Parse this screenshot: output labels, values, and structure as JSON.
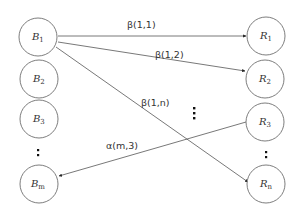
{
  "diagram": {
    "left_nodes": [
      {
        "id": "B1",
        "base": "B",
        "sub": "1"
      },
      {
        "id": "B2",
        "base": "B",
        "sub": "2"
      },
      {
        "id": "B3",
        "base": "B",
        "sub": "3"
      },
      {
        "id": "Bm",
        "base": "B",
        "sub": "m"
      }
    ],
    "right_nodes": [
      {
        "id": "R1",
        "base": "R",
        "sub": "1"
      },
      {
        "id": "R2",
        "base": "R",
        "sub": "2"
      },
      {
        "id": "R3",
        "base": "R",
        "sub": "3"
      },
      {
        "id": "Rn",
        "base": "R",
        "sub": "n"
      }
    ],
    "edges": [
      {
        "from": "B1",
        "to": "R1",
        "label": "β(1,1)"
      },
      {
        "from": "B1",
        "to": "R2",
        "label": "β(1,2)"
      },
      {
        "from": "B1",
        "to": "Rn",
        "label": "β(1,n)"
      },
      {
        "from": "R3",
        "to": "Bm",
        "label": "α(m,3)"
      }
    ],
    "ellipsis_markers": [
      "left-column",
      "right-column",
      "middle"
    ]
  }
}
